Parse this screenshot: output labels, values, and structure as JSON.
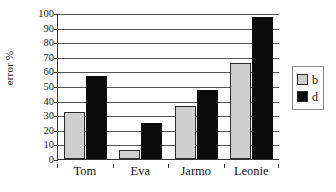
{
  "chart_data": {
    "type": "bar",
    "title": "",
    "xlabel": "",
    "ylabel": "error %",
    "ylim": [
      0,
      100
    ],
    "yticks": [
      0,
      10,
      20,
      30,
      40,
      50,
      60,
      70,
      80,
      90,
      100
    ],
    "ytick_labels": [
      "0",
      "10",
      "20",
      "30",
      "40",
      "50",
      "60",
      "70",
      "80",
      "90",
      "100"
    ],
    "grid": true,
    "legend_position": "right",
    "categories": [
      "Tom",
      "Eva",
      "Jarmo",
      "Leonie"
    ],
    "series": [
      {
        "name": "b",
        "color": "#cfcfcf",
        "values": [
          32,
          6,
          36,
          66
        ]
      },
      {
        "name": "d",
        "color": "#0b0b0b",
        "values": [
          57,
          25,
          47,
          97
        ]
      }
    ]
  },
  "legend": {
    "entries": [
      {
        "label": "b"
      },
      {
        "label": "d"
      }
    ]
  },
  "colors": {
    "series_b": "#cfcfcf",
    "series_d": "#0b0b0b",
    "axis": "#333333",
    "grid": "#545454",
    "background": "#ffffff"
  }
}
